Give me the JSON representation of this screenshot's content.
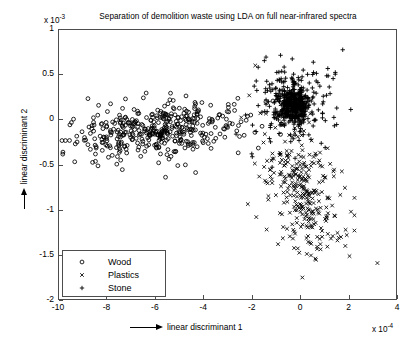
{
  "chart_data": {
    "type": "scatter",
    "title": "Separation of demolition waste using LDA on full near-infrared spectra",
    "xlabel": "linear discriminant 1",
    "ylabel": "linear discriminant 2",
    "x_exponent": "x 10",
    "x_exponent_power": "-4",
    "y_exponent": "x 10",
    "y_exponent_power": "-3",
    "xlim": [
      -10,
      4
    ],
    "ylim": [
      -2,
      1
    ],
    "xticks": [
      -10,
      -8,
      -6,
      -4,
      -2,
      0,
      2,
      4
    ],
    "xtick_labels": [
      "-10",
      "-8",
      "-6",
      "-4",
      "-2",
      "0",
      "2",
      "4"
    ],
    "yticks": [
      1,
      0.5,
      0,
      -0.5,
      -1,
      -1.5,
      -2
    ],
    "ytick_labels": [
      "1",
      "0.5",
      "0",
      "-0.5",
      "-1",
      "-1.5",
      "-2"
    ],
    "grid": false,
    "legend_position": "lower-left",
    "marker_color": "#000000",
    "series": [
      {
        "name": "Wood",
        "marker": "circle",
        "count": 420,
        "center": [
          -6.0,
          -0.12
        ],
        "spread": [
          1.75,
          0.14
        ],
        "note": "dense elongated horizontal band spanning x from -10 to -2.2, centered near y = -0.1"
      },
      {
        "name": "Plastics",
        "marker": "x",
        "count": 300,
        "center": [
          0.1,
          -0.78
        ],
        "spread": [
          0.85,
          0.33
        ],
        "note": "diffuse cloud in lower right quadrant, extends from y = -0.3 down to -1.75"
      },
      {
        "name": "Stone",
        "marker": "plus",
        "count": 560,
        "center": [
          -0.35,
          0.17
        ],
        "spread": [
          0.55,
          0.16
        ],
        "note": "very dense compact blob just right of x = -2, centered near y = 0.15"
      }
    ]
  },
  "legend": {
    "entries": [
      {
        "label": "Wood",
        "marker": "circle"
      },
      {
        "label": "Plastics",
        "marker": "x"
      },
      {
        "label": "Stone",
        "marker": "plus"
      }
    ]
  }
}
